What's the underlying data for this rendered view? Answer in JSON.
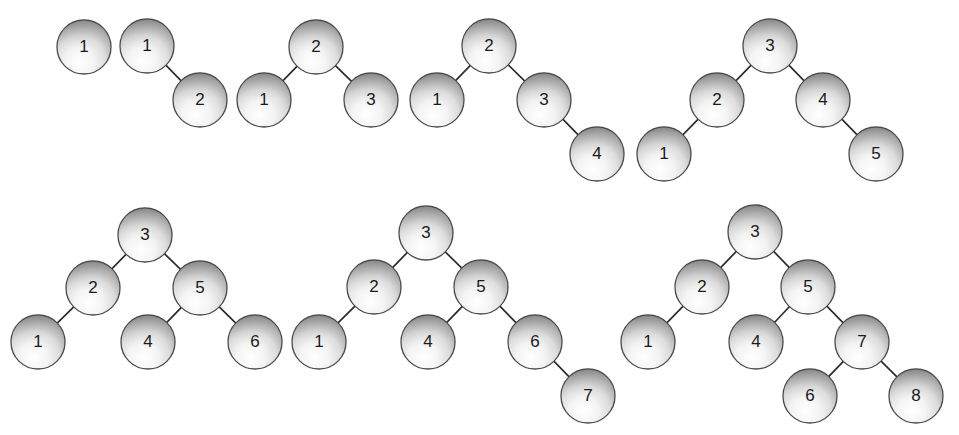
{
  "figure": {
    "background_color": "#ffffff",
    "width": 959,
    "height": 435,
    "node_radius": 27,
    "node_fill_light": "#fbfbfb",
    "node_fill_mid": "#d8d8d8",
    "node_fill_dark": "#8d8d8d",
    "node_stroke_color": "#4a4a4a",
    "edge_color": "#2b2b2b",
    "label_color": "#1a1a1a"
  },
  "trees": [
    {
      "name": "tree-1-node",
      "node_count": 1,
      "nodes": [
        {
          "id": "t1n1",
          "label": "1",
          "x": 84,
          "y": 47
        }
      ],
      "edges": []
    },
    {
      "name": "tree-2-nodes",
      "node_count": 2,
      "nodes": [
        {
          "id": "t2n1",
          "label": "1",
          "x": 147,
          "y": 46
        },
        {
          "id": "t2n2",
          "label": "2",
          "x": 200,
          "y": 100
        }
      ],
      "edges": [
        {
          "from": "t2n1",
          "to": "t2n2"
        }
      ]
    },
    {
      "name": "tree-3-nodes",
      "node_count": 3,
      "nodes": [
        {
          "id": "t3n2",
          "label": "2",
          "x": 316,
          "y": 47
        },
        {
          "id": "t3n1",
          "label": "1",
          "x": 264,
          "y": 100
        },
        {
          "id": "t3n3",
          "label": "3",
          "x": 371,
          "y": 100
        }
      ],
      "edges": [
        {
          "from": "t3n2",
          "to": "t3n1"
        },
        {
          "from": "t3n2",
          "to": "t3n3"
        }
      ]
    },
    {
      "name": "tree-4-nodes",
      "node_count": 4,
      "nodes": [
        {
          "id": "t4n2",
          "label": "2",
          "x": 489,
          "y": 46
        },
        {
          "id": "t4n1",
          "label": "1",
          "x": 437,
          "y": 100
        },
        {
          "id": "t4n3",
          "label": "3",
          "x": 544,
          "y": 100
        },
        {
          "id": "t4n4",
          "label": "4",
          "x": 597,
          "y": 154
        }
      ],
      "edges": [
        {
          "from": "t4n2",
          "to": "t4n1"
        },
        {
          "from": "t4n2",
          "to": "t4n3"
        },
        {
          "from": "t4n3",
          "to": "t4n4"
        }
      ]
    },
    {
      "name": "tree-5-nodes",
      "node_count": 5,
      "nodes": [
        {
          "id": "t5n3",
          "label": "3",
          "x": 770,
          "y": 46
        },
        {
          "id": "t5n2",
          "label": "2",
          "x": 717,
          "y": 100
        },
        {
          "id": "t5n1",
          "label": "1",
          "x": 664,
          "y": 154
        },
        {
          "id": "t5n4",
          "label": "4",
          "x": 823,
          "y": 100
        },
        {
          "id": "t5n5",
          "label": "5",
          "x": 876,
          "y": 154
        }
      ],
      "edges": [
        {
          "from": "t5n3",
          "to": "t5n2"
        },
        {
          "from": "t5n2",
          "to": "t5n1"
        },
        {
          "from": "t5n3",
          "to": "t5n4"
        },
        {
          "from": "t5n4",
          "to": "t5n5"
        }
      ]
    },
    {
      "name": "tree-6-nodes",
      "node_count": 6,
      "nodes": [
        {
          "id": "t6n3",
          "label": "3",
          "x": 145,
          "y": 235
        },
        {
          "id": "t6n2",
          "label": "2",
          "x": 93,
          "y": 288
        },
        {
          "id": "t6n1",
          "label": "1",
          "x": 38,
          "y": 342
        },
        {
          "id": "t6n5",
          "label": "5",
          "x": 200,
          "y": 288
        },
        {
          "id": "t6n4",
          "label": "4",
          "x": 148,
          "y": 342
        },
        {
          "id": "t6n6",
          "label": "6",
          "x": 255,
          "y": 342
        }
      ],
      "edges": [
        {
          "from": "t6n3",
          "to": "t6n2"
        },
        {
          "from": "t6n2",
          "to": "t6n1"
        },
        {
          "from": "t6n3",
          "to": "t6n5"
        },
        {
          "from": "t6n5",
          "to": "t6n4"
        },
        {
          "from": "t6n5",
          "to": "t6n6"
        }
      ]
    },
    {
      "name": "tree-7-nodes",
      "node_count": 7,
      "nodes": [
        {
          "id": "t7n3",
          "label": "3",
          "x": 426,
          "y": 233
        },
        {
          "id": "t7n2",
          "label": "2",
          "x": 374,
          "y": 287
        },
        {
          "id": "t7n1",
          "label": "1",
          "x": 319,
          "y": 342
        },
        {
          "id": "t7n5",
          "label": "5",
          "x": 481,
          "y": 287
        },
        {
          "id": "t7n4",
          "label": "4",
          "x": 428,
          "y": 342
        },
        {
          "id": "t7n6",
          "label": "6",
          "x": 535,
          "y": 342
        },
        {
          "id": "t7n7",
          "label": "7",
          "x": 588,
          "y": 396
        }
      ],
      "edges": [
        {
          "from": "t7n3",
          "to": "t7n2"
        },
        {
          "from": "t7n2",
          "to": "t7n1"
        },
        {
          "from": "t7n3",
          "to": "t7n5"
        },
        {
          "from": "t7n5",
          "to": "t7n4"
        },
        {
          "from": "t7n5",
          "to": "t7n6"
        },
        {
          "from": "t7n6",
          "to": "t7n7"
        }
      ]
    },
    {
      "name": "tree-8-nodes",
      "node_count": 8,
      "nodes": [
        {
          "id": "t8n3",
          "label": "3",
          "x": 755,
          "y": 232
        },
        {
          "id": "t8n2",
          "label": "2",
          "x": 702,
          "y": 287
        },
        {
          "id": "t8n1",
          "label": "1",
          "x": 648,
          "y": 342
        },
        {
          "id": "t8n5",
          "label": "5",
          "x": 808,
          "y": 287
        },
        {
          "id": "t8n4",
          "label": "4",
          "x": 756,
          "y": 342
        },
        {
          "id": "t8n7",
          "label": "7",
          "x": 862,
          "y": 342
        },
        {
          "id": "t8n6",
          "label": "6",
          "x": 810,
          "y": 396
        },
        {
          "id": "t8n8",
          "label": "8",
          "x": 916,
          "y": 396
        }
      ],
      "edges": [
        {
          "from": "t8n3",
          "to": "t8n2"
        },
        {
          "from": "t8n2",
          "to": "t8n1"
        },
        {
          "from": "t8n3",
          "to": "t8n5"
        },
        {
          "from": "t8n5",
          "to": "t8n4"
        },
        {
          "from": "t8n5",
          "to": "t8n7"
        },
        {
          "from": "t8n7",
          "to": "t8n6"
        },
        {
          "from": "t8n7",
          "to": "t8n8"
        }
      ]
    }
  ]
}
